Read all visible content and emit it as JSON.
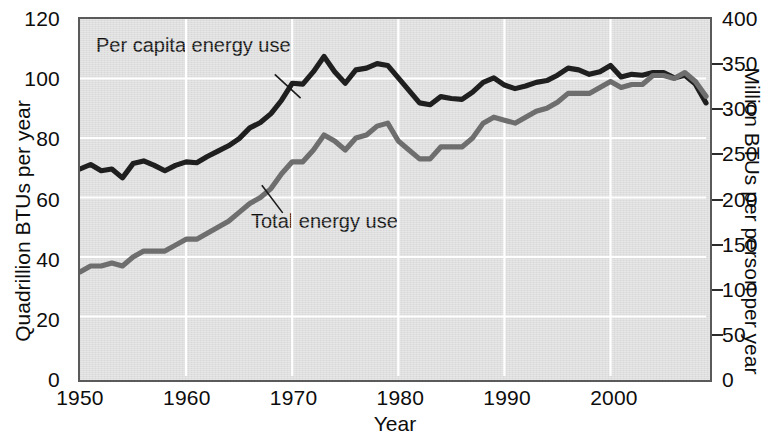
{
  "chart_data": {
    "type": "line",
    "title": "",
    "xlabel": "Year",
    "ylabel": "Quadrillion BTUs per year",
    "ylabel_right": "Million BTUs per person per year",
    "xlim": [
      1950,
      2009
    ],
    "ylim": [
      0,
      120
    ],
    "ylim_right": [
      0,
      400
    ],
    "grid": true,
    "legend_position": "in-plot annotations",
    "xticks": [
      "1950",
      "1960",
      "1970",
      "1980",
      "1990",
      "2000"
    ],
    "xtick_values": [
      1950,
      1960,
      1970,
      1980,
      1990,
      2000
    ],
    "yticks_left": [
      "0",
      "20",
      "40",
      "60",
      "80",
      "100",
      "120"
    ],
    "ytick_values_left": [
      0,
      20,
      40,
      60,
      80,
      100,
      120
    ],
    "yticks_right": [
      "0",
      "50",
      "100",
      "150",
      "200",
      "250",
      "300",
      "350",
      "400"
    ],
    "ytick_values_right": [
      0,
      50,
      100,
      150,
      200,
      250,
      300,
      350,
      400
    ],
    "x": [
      1950,
      1951,
      1952,
      1953,
      1954,
      1955,
      1956,
      1957,
      1958,
      1959,
      1960,
      1961,
      1962,
      1963,
      1964,
      1965,
      1966,
      1967,
      1968,
      1969,
      1970,
      1971,
      1972,
      1973,
      1974,
      1975,
      1976,
      1977,
      1978,
      1979,
      1980,
      1981,
      1982,
      1983,
      1984,
      1985,
      1986,
      1987,
      1988,
      1989,
      1990,
      1991,
      1992,
      1993,
      1994,
      1995,
      1996,
      1997,
      1998,
      1999,
      2000,
      2001,
      2002,
      2003,
      2004,
      2005,
      2006,
      2007,
      2008,
      2009
    ],
    "series": [
      {
        "name": "Per capita energy use",
        "axis": "right",
        "color": "#1f1f1f",
        "units": "Million BTUs per person per year",
        "values": [
          232,
          237,
          230,
          232,
          222,
          238,
          241,
          236,
          230,
          236,
          240,
          239,
          246,
          252,
          258,
          266,
          278,
          284,
          294,
          309,
          328,
          327,
          341,
          358,
          341,
          328,
          343,
          345,
          350,
          348,
          334,
          320,
          306,
          304,
          313,
          311,
          310,
          318,
          329,
          334,
          326,
          322,
          325,
          329,
          331,
          337,
          345,
          343,
          338,
          341,
          348,
          335,
          338,
          337,
          340,
          340,
          334,
          337,
          327,
          306
        ]
      },
      {
        "name": "Total energy use",
        "axis": "left",
        "color": "#6e6e6e",
        "units": "Quadrillion BTUs per year",
        "values": [
          35,
          37,
          37,
          38,
          37,
          40,
          42,
          42,
          42,
          44,
          46,
          46,
          48,
          50,
          52,
          55,
          58,
          60,
          63,
          68,
          72,
          72,
          76,
          81,
          79,
          76,
          80,
          81,
          84,
          85,
          79,
          76,
          73,
          73,
          77,
          77,
          77,
          80,
          85,
          87,
          86,
          85,
          87,
          89,
          90,
          92,
          95,
          95,
          95,
          97,
          99,
          97,
          98,
          98,
          101,
          101,
          100,
          102,
          99,
          94
        ]
      }
    ],
    "annotations": [
      {
        "text": "Per capita energy use",
        "points_to": "dark-line"
      },
      {
        "text": "Total energy use",
        "points_to": "gray-line"
      }
    ]
  },
  "colors": {
    "plot_background": "#dfdfdf",
    "gridline": "#ffffff",
    "frame": "#5a5a5a",
    "per_capita_line": "#1f1f1f",
    "total_line": "#6e6e6e",
    "text": "#0d0d0d"
  }
}
